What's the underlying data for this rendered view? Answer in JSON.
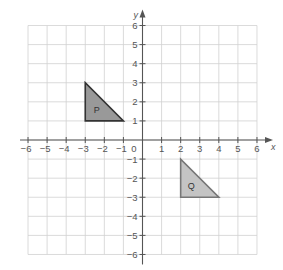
{
  "diagram": {
    "type": "coordinate-grid",
    "axes": {
      "x_label": "x",
      "y_label": "y",
      "origin_label": "0",
      "x_range": [
        -6,
        6
      ],
      "y_range": [
        -6,
        6
      ],
      "x_ticks": [
        "-6",
        "-5",
        "-4",
        "-3",
        "-2",
        "-1",
        "1",
        "2",
        "3",
        "4",
        "5",
        "6"
      ],
      "y_ticks": [
        "6",
        "5",
        "4",
        "3",
        "2",
        "1",
        "-1",
        "-2",
        "-3",
        "-4",
        "-5",
        "-6"
      ]
    },
    "shapes": [
      {
        "label": "P",
        "vertices": [
          [
            -3,
            1
          ],
          [
            -3,
            3
          ],
          [
            -1,
            1
          ]
        ],
        "label_pos": [
          -2.4,
          1.55
        ],
        "fill": "#999999",
        "stroke": "#333333"
      },
      {
        "label": "Q",
        "vertices": [
          [
            2,
            -1
          ],
          [
            2,
            -3
          ],
          [
            4,
            -3
          ]
        ],
        "label_pos": [
          2.55,
          -2.45
        ],
        "fill": "#c4c4c4",
        "stroke": "#777777"
      }
    ],
    "colors": {
      "grid": "#d0d0d0",
      "axis": "#555555",
      "tick_label": "#555555"
    }
  }
}
